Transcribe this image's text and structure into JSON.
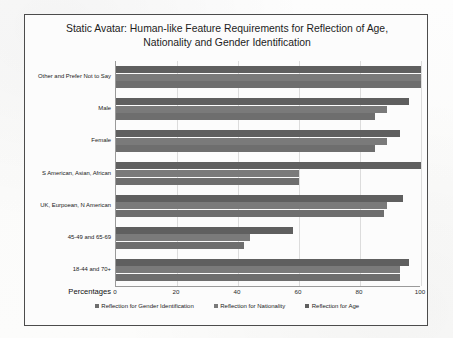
{
  "chart_data": {
    "type": "bar",
    "orientation": "horizontal",
    "title": "Static Avatar: Human-like Feature Requirements for Reflection of Age, Nationality and Gender Identification",
    "xlabel": "Percentages",
    "ylabel": "",
    "xlim": [
      0,
      100
    ],
    "xticks": [
      0,
      20,
      40,
      60,
      80,
      100
    ],
    "grid": true,
    "legend_position": "bottom",
    "categories": [
      "Other and Prefer Not to Say",
      "Male",
      "Female",
      "S American, Asian, African",
      "UK, Eurpoean, N American",
      "45-49 and 65-69",
      "18-44 and 70+"
    ],
    "series": [
      {
        "name": "Reflection for Age",
        "color": "#5f5f5f",
        "values": [
          100,
          96,
          93,
          100,
          94,
          58,
          96
        ]
      },
      {
        "name": "Reflection for Nationality",
        "color": "#7a7a7a",
        "values": [
          100,
          89,
          89,
          60,
          89,
          44,
          93
        ]
      },
      {
        "name": "Reflection for Gender Identification",
        "color": "#6e6e6e",
        "values": [
          100,
          85,
          85,
          60,
          88,
          42,
          93
        ]
      }
    ]
  },
  "legend": [
    {
      "label": "Reflection for Gender Identification",
      "color": "#6e6e6e"
    },
    {
      "label": "Reflection for Nationality",
      "color": "#7a7a7a"
    },
    {
      "label": "Reflection for Age",
      "color": "#5f5f5f"
    }
  ]
}
